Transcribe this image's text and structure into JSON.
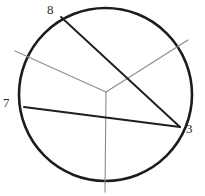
{
  "figure": {
    "type": "circle-with-chords-and-rays",
    "canvas": {
      "width": 205,
      "height": 196,
      "background": "#ffffff"
    },
    "circle": {
      "name": "main-circle",
      "cx": 105.5,
      "cy": 94.5,
      "r": 86.5,
      "stroke": "#1c1c1c",
      "stroke_width": 2.6
    },
    "interior_junction": {
      "x": 106,
      "y": 92
    },
    "labels": [
      {
        "id": "label-8",
        "text": "8",
        "x": 47,
        "y": 3
      },
      {
        "id": "label-7",
        "text": "7",
        "x": 3,
        "y": 96
      },
      {
        "id": "label-3",
        "text": "3",
        "x": 186,
        "y": 122
      }
    ],
    "points": [
      {
        "id": "point-8",
        "label": "8",
        "x": 61,
        "y": 17
      },
      {
        "id": "point-7",
        "label": "7",
        "x": 24,
        "y": 107
      },
      {
        "id": "point-3",
        "label": "3",
        "x": 180,
        "y": 127
      }
    ],
    "chords": [
      {
        "id": "chord-8-3",
        "from": "8",
        "to": "3",
        "x1": 61,
        "y1": 17,
        "x2": 180,
        "y2": 127,
        "stroke": "#1f1f1f",
        "stroke_width": 1.9
      },
      {
        "id": "chord-7-3",
        "from": "7",
        "to": "3",
        "x1": 24,
        "y1": 107,
        "x2": 180,
        "y2": 127,
        "stroke": "#1f1f1f",
        "stroke_width": 1.9
      }
    ],
    "rays": [
      {
        "id": "ray-upper-left",
        "x1": 106,
        "y1": 92,
        "x2": 15,
        "y2": 51,
        "stroke": "#8c8c8c",
        "stroke_width": 1.1
      },
      {
        "id": "ray-upper-right",
        "x1": 106,
        "y1": 92,
        "x2": 188,
        "y2": 40,
        "stroke": "#8c8c8c",
        "stroke_width": 1.1
      },
      {
        "id": "ray-down",
        "x1": 106,
        "y1": 92,
        "x2": 105,
        "y2": 192,
        "stroke": "#8c8c8c",
        "stroke_width": 1.1
      }
    ]
  }
}
